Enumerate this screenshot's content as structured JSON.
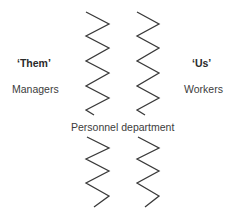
{
  "diagram": {
    "left_group": {
      "title": "‘Them’",
      "subtitle": "Managers"
    },
    "right_group": {
      "title": "‘Us’",
      "subtitle": "Workers"
    },
    "center_label": "Personnel department",
    "divider_style": {
      "stroke_color": "#3a3a3a",
      "stroke_width": 1.3
    }
  }
}
